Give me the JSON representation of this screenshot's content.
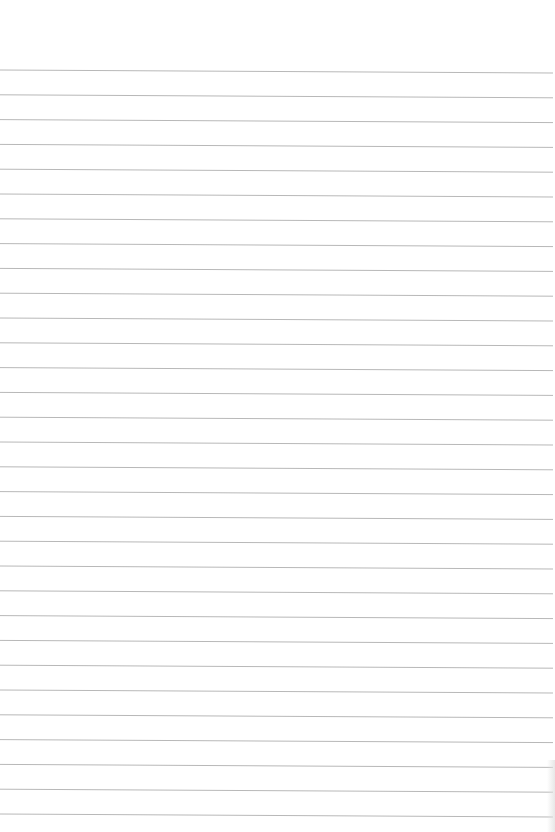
{
  "sheet": {
    "type": "ruled-paper",
    "background_color": "#ffffff",
    "line_color": "#b8b8b8",
    "line_count": 31,
    "first_line_y": 70,
    "line_spacing": 24.8,
    "line_slope_px": 3,
    "line_start_x": 0,
    "line_end_x": 553,
    "text": ""
  }
}
